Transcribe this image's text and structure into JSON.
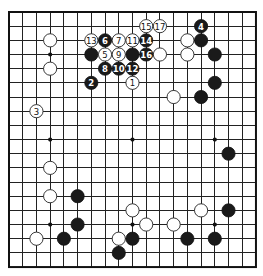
{
  "board": {
    "size": 19,
    "origin_x": 9,
    "origin_y": 12,
    "spacing_x": 13.72,
    "spacing_y": 14.17,
    "stone_radius": 6.6,
    "colors": {
      "black": "#1a1a1a",
      "white": "#ffffff",
      "line": "#222222"
    },
    "hoshi": [
      [
        3,
        3
      ],
      [
        9,
        3
      ],
      [
        15,
        3
      ],
      [
        3,
        9
      ],
      [
        9,
        9
      ],
      [
        15,
        9
      ],
      [
        3,
        15
      ],
      [
        9,
        15
      ],
      [
        15,
        15
      ]
    ],
    "stones": [
      {
        "col": 3,
        "row": 2,
        "color": "white"
      },
      {
        "col": 3,
        "row": 4,
        "color": "white"
      },
      {
        "col": 6,
        "row": 3,
        "color": "black"
      },
      {
        "col": 9,
        "row": 3,
        "color": "black"
      },
      {
        "col": 11,
        "row": 3,
        "color": "white"
      },
      {
        "col": 13,
        "row": 2,
        "color": "white"
      },
      {
        "col": 14,
        "row": 2,
        "color": "black"
      },
      {
        "col": 13,
        "row": 3,
        "color": "white"
      },
      {
        "col": 15,
        "row": 3,
        "color": "black"
      },
      {
        "col": 15,
        "row": 5,
        "color": "black"
      },
      {
        "col": 12,
        "row": 6,
        "color": "white"
      },
      {
        "col": 14,
        "row": 6,
        "color": "black"
      },
      {
        "col": 16,
        "row": 10,
        "color": "black"
      },
      {
        "col": 3,
        "row": 11,
        "color": "white"
      },
      {
        "col": 3,
        "row": 13,
        "color": "white"
      },
      {
        "col": 5,
        "row": 13,
        "color": "black"
      },
      {
        "col": 5,
        "row": 15,
        "color": "black"
      },
      {
        "col": 2,
        "row": 16,
        "color": "white"
      },
      {
        "col": 4,
        "row": 16,
        "color": "black"
      },
      {
        "col": 9,
        "row": 14,
        "color": "white"
      },
      {
        "col": 10,
        "row": 15,
        "color": "white"
      },
      {
        "col": 12,
        "row": 15,
        "color": "white"
      },
      {
        "col": 8,
        "row": 16,
        "color": "white"
      },
      {
        "col": 9,
        "row": 16,
        "color": "black"
      },
      {
        "col": 8,
        "row": 17,
        "color": "black"
      },
      {
        "col": 14,
        "row": 14,
        "color": "white"
      },
      {
        "col": 16,
        "row": 14,
        "color": "black"
      },
      {
        "col": 13,
        "row": 16,
        "color": "black"
      },
      {
        "col": 15,
        "row": 16,
        "color": "black"
      }
    ],
    "moves": [
      {
        "number": "1",
        "col": 9,
        "row": 5,
        "color": "white"
      },
      {
        "number": "2",
        "col": 6,
        "row": 5,
        "color": "black"
      },
      {
        "number": "3",
        "col": 2,
        "row": 7,
        "color": "white"
      },
      {
        "number": "4",
        "col": 14,
        "row": 1,
        "color": "black"
      },
      {
        "number": "5",
        "col": 7,
        "row": 3,
        "color": "white"
      },
      {
        "number": "6",
        "col": 7,
        "row": 2,
        "color": "black"
      },
      {
        "number": "7",
        "col": 8,
        "row": 2,
        "color": "white"
      },
      {
        "number": "8",
        "col": 7,
        "row": 4,
        "color": "black"
      },
      {
        "number": "9",
        "col": 8,
        "row": 3,
        "color": "white"
      },
      {
        "number": "10",
        "col": 8,
        "row": 4,
        "color": "black"
      },
      {
        "number": "11",
        "col": 9,
        "row": 2,
        "color": "white"
      },
      {
        "number": "12",
        "col": 9,
        "row": 4,
        "color": "black"
      },
      {
        "number": "13",
        "col": 6,
        "row": 2,
        "color": "white"
      },
      {
        "number": "14",
        "col": 10,
        "row": 2,
        "color": "black"
      },
      {
        "number": "15",
        "col": 10,
        "row": 1,
        "color": "white"
      },
      {
        "number": "16",
        "col": 10,
        "row": 3,
        "color": "black"
      },
      {
        "number": "17",
        "col": 11,
        "row": 1,
        "color": "white"
      }
    ]
  }
}
